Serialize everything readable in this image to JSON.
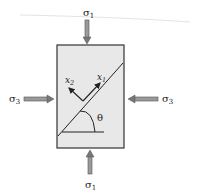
{
  "diagram": {
    "title": "",
    "labels": {
      "sigma1_top": "σ",
      "sigma1_top_sub": "1",
      "sigma1_bottom": "σ",
      "sigma1_bottom_sub": "1",
      "sigma3_left": "σ",
      "sigma3_left_sub": "3",
      "sigma3_right": "σ",
      "sigma3_right_sub": "3",
      "x1": "x",
      "x1_sub": "1",
      "x2": "x",
      "x2_sub": "2",
      "theta": "θ"
    },
    "colors": {
      "box_fill": "#e8e8e8",
      "stroke": "#333333",
      "arrow_fill": "#9a9a9a"
    },
    "elements": [
      "specimen-box",
      "inclined-plane",
      "horizontal-reference-line",
      "theta-arc",
      "x1-axis-arrow",
      "x2-axis-arrow",
      "sigma1-top-arrow",
      "sigma1-bottom-arrow",
      "sigma3-left-arrow",
      "sigma3-right-arrow"
    ]
  }
}
